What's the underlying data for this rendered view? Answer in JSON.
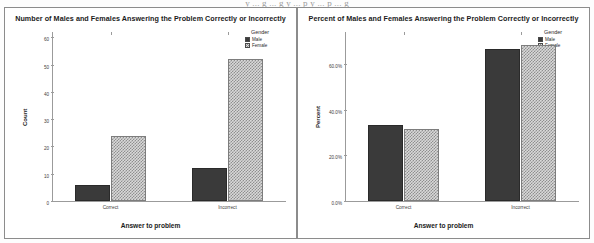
{
  "top_cut_text": "y  ...  g  ...  g  y  ...  p  y  ...  p  ...  g",
  "legend": {
    "title": "Gender",
    "items": [
      {
        "label": "Male",
        "swatch": "solid-dark-swatch",
        "color": "#3a3a3a"
      },
      {
        "label": "Female",
        "swatch": "checkered-light-swatch",
        "color": "#d9d9d9"
      }
    ]
  },
  "chart_data": [
    {
      "type": "bar",
      "title": "Number of Males and Females Answering the Problem Correctly or Incorrectly",
      "xlabel": "Answer to problem",
      "ylabel": "Count",
      "categories": [
        "Correct",
        "Incorrect"
      ],
      "series": [
        {
          "name": "Male",
          "values": [
            6,
            12
          ]
        },
        {
          "name": "Female",
          "values": [
            24,
            52
          ]
        }
      ],
      "yticks": [
        "0",
        "10",
        "20",
        "30",
        "40",
        "50",
        "60"
      ],
      "ytick_values": [
        0,
        10,
        20,
        30,
        40,
        50,
        60
      ],
      "ylim": [
        0,
        62
      ],
      "grid": false,
      "legend_position": "top-right"
    },
    {
      "type": "bar",
      "title": "Percent of Males and Females Answering the Problem Correctly or Incorrectly",
      "xlabel": "Answer to problem",
      "ylabel": "Percent",
      "categories": [
        "Correct",
        "Incorrect"
      ],
      "series": [
        {
          "name": "Male",
          "values": [
            33.3,
            66.7
          ]
        },
        {
          "name": "Female",
          "values": [
            31.6,
            68.4
          ]
        }
      ],
      "yticks": [
        "0.0%",
        "20.0%",
        "40.0%",
        "60.0%"
      ],
      "ytick_values": [
        0,
        20,
        40,
        60
      ],
      "ylim": [
        0,
        74
      ],
      "grid": false,
      "legend_position": "top-right"
    }
  ]
}
